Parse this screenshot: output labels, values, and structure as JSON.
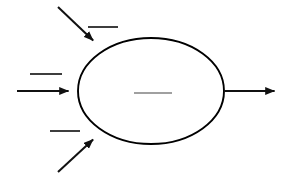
{
  "canvas": {
    "width": 299,
    "height": 183,
    "background_color": "#ffffff",
    "title": "Process Diagram"
  },
  "colors": {
    "stroke": "#111111",
    "shape_stroke": "#000000",
    "shape_fill": "#ffffff",
    "label_dash": "#333333",
    "center_dash": "#808080"
  },
  "shapes": [
    {
      "id": "process-ellipse",
      "type": "ellipse",
      "cx": 151,
      "cy": 91,
      "rx": 73,
      "ry": 53,
      "label": "",
      "label_redacted": true
    }
  ],
  "connectors": [
    {
      "id": "input-arrow-top",
      "direction": "incoming",
      "orientation": "diagonal-down-right",
      "x1": 58,
      "y1": 7,
      "x2": 100,
      "y2": 47,
      "label": "",
      "label_redacted": true
    },
    {
      "id": "input-arrow-middle",
      "direction": "incoming",
      "orientation": "horizontal-right",
      "x1": 17,
      "y1": 91,
      "x2": 78,
      "y2": 91,
      "label": "",
      "label_redacted": true
    },
    {
      "id": "input-arrow-bottom",
      "direction": "incoming",
      "orientation": "diagonal-up-right",
      "x1": 58,
      "y1": 172,
      "x2": 100,
      "y2": 133,
      "label": "",
      "label_redacted": true
    },
    {
      "id": "output-arrow",
      "direction": "outgoing",
      "orientation": "horizontal-right",
      "x1": 224,
      "y1": 91,
      "x2": 284,
      "y2": 91,
      "label": "",
      "label_redacted": true
    }
  ],
  "labels": [
    {
      "id": "label-top-input",
      "for": "input-arrow-top",
      "text": "",
      "redacted": true,
      "x1": 88,
      "y1": 27,
      "x2": 118,
      "y2": 27
    },
    {
      "id": "label-middle-input",
      "for": "input-arrow-middle",
      "text": "",
      "redacted": true,
      "x1": 30,
      "y1": 74,
      "x2": 62,
      "y2": 74
    },
    {
      "id": "label-bottom-input",
      "for": "input-arrow-bottom",
      "text": "",
      "redacted": true,
      "x1": 50,
      "y1": 131,
      "x2": 80,
      "y2": 131
    },
    {
      "id": "label-process",
      "for": "process-ellipse",
      "text": "",
      "redacted": true,
      "x1": 134,
      "y1": 93,
      "x2": 172,
      "y2": 93
    }
  ]
}
